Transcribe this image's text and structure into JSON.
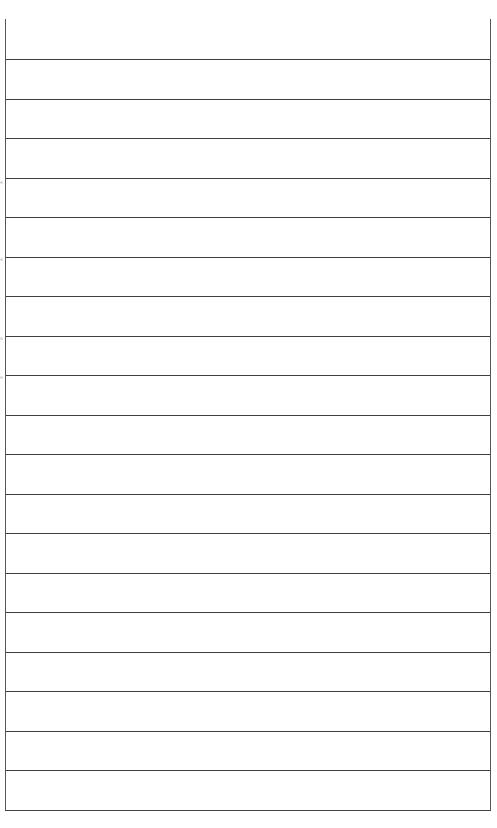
{
  "page": {
    "type": "blank-ruled-sheet",
    "background_color": "#ffffff",
    "line_color": "#3f3f3f",
    "border_color": "#555555",
    "has_top_border": false,
    "line_spacing_px": 39.5,
    "rows": [
      {
        "text": ""
      },
      {
        "text": ""
      },
      {
        "text": ""
      },
      {
        "text": ""
      },
      {
        "text": ""
      },
      {
        "text": ""
      },
      {
        "text": ""
      },
      {
        "text": ""
      },
      {
        "text": ""
      },
      {
        "text": ""
      },
      {
        "text": ""
      },
      {
        "text": ""
      },
      {
        "text": ""
      },
      {
        "text": ""
      },
      {
        "text": ""
      },
      {
        "text": ""
      },
      {
        "text": ""
      },
      {
        "text": ""
      },
      {
        "text": ""
      },
      {
        "text": ""
      }
    ]
  }
}
